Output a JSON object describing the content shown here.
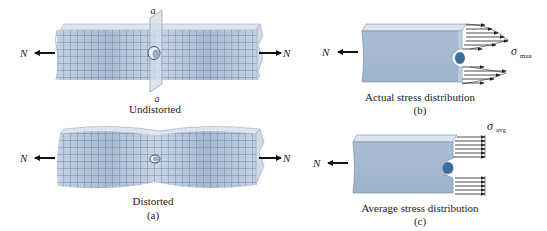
{
  "figure": {
    "panel_a": {
      "undistorted": {
        "caption": "Undistorted",
        "section_label_top": "a",
        "section_label_bottom": "a",
        "force_left": "N",
        "force_right": "N"
      },
      "distorted": {
        "caption": "Distorted",
        "force_left": "N",
        "force_right": "N"
      },
      "panel_label": "(a)"
    },
    "panel_b": {
      "caption": "Actual stress distribution",
      "panel_label": "(b)",
      "force_left": "N",
      "stress_symbol": "σ",
      "stress_subscript": "max"
    },
    "panel_c": {
      "caption": "Average stress distribution",
      "panel_label": "(c)",
      "force_left": "N",
      "stress_symbol": "σ",
      "stress_subscript": "avg"
    }
  },
  "colors": {
    "bar_face": "#b9c9dc",
    "bar_top": "#dbe5ef",
    "bar_dark": "#8ea4bf",
    "grid": "#5a6f8e",
    "hole": "#3d6d9a",
    "arrow": "#111111",
    "text": "#222222"
  }
}
